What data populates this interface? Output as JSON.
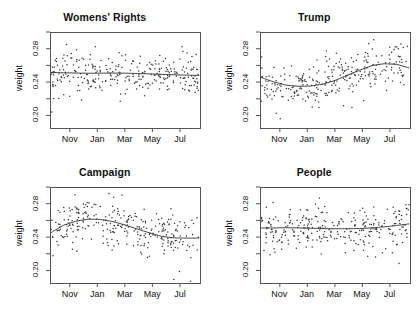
{
  "figure": {
    "background": "#ffffff",
    "point_color": "#333333",
    "line_color": "#444444",
    "axis_color": "#555555",
    "layout": "2x2",
    "panel_order": [
      "womens-rights",
      "trump",
      "campaign",
      "people"
    ]
  },
  "chart_data": [
    {
      "type": "scatter",
      "title": "Womens' Rights",
      "xlabel": "",
      "ylabel": "weight",
      "ylim": [
        0.185,
        0.3
      ],
      "yticks": [
        0.2,
        0.24,
        0.28
      ],
      "ytick_labels": [
        "0.20",
        "0.24",
        "0.28"
      ],
      "ytick_minor": [
        0.22,
        0.26,
        0.3
      ],
      "xticks": [
        "Nov",
        "Jan",
        "Mar",
        "May",
        "Jul"
      ],
      "xlim_months": [
        9.5,
        19.5
      ],
      "grid": false,
      "legend": null,
      "n_points": 290,
      "smoother": "loess",
      "smoother_x": [
        0,
        0.08,
        0.17,
        0.25,
        0.33,
        0.42,
        0.5,
        0.58,
        0.67,
        0.75,
        0.83,
        0.92,
        1.0
      ],
      "smoother_y": [
        0.2515,
        0.2512,
        0.2508,
        0.2506,
        0.2507,
        0.2508,
        0.2507,
        0.2503,
        0.2498,
        0.2492,
        0.2487,
        0.2483,
        0.248
      ],
      "point_spread": 0.019,
      "seed": 11
    },
    {
      "type": "scatter",
      "title": "Trump",
      "xlabel": "",
      "ylabel": "weight",
      "ylim": [
        0.185,
        0.3
      ],
      "yticks": [
        0.2,
        0.24,
        0.28
      ],
      "ytick_labels": [
        "0.20",
        "0.24",
        "0.28"
      ],
      "ytick_minor": [
        0.22,
        0.26,
        0.3
      ],
      "xticks": [
        "Nov",
        "Jan",
        "Mar",
        "May",
        "Jul"
      ],
      "xlim_months": [
        9.5,
        19.5
      ],
      "grid": false,
      "legend": null,
      "n_points": 290,
      "smoother": "loess",
      "smoother_x": [
        0,
        0.08,
        0.17,
        0.25,
        0.33,
        0.42,
        0.5,
        0.58,
        0.67,
        0.75,
        0.83,
        0.92,
        1.0
      ],
      "smoother_y": [
        0.2455,
        0.2405,
        0.2363,
        0.235,
        0.2352,
        0.2375,
        0.242,
        0.248,
        0.2545,
        0.2598,
        0.262,
        0.2612,
        0.257
      ],
      "point_spread": 0.02,
      "seed": 23
    },
    {
      "type": "scatter",
      "title": "Campaign",
      "xlabel": "",
      "ylabel": "weight",
      "ylim": [
        0.185,
        0.3
      ],
      "yticks": [
        0.2,
        0.24,
        0.28
      ],
      "ytick_labels": [
        "0.20",
        "0.24",
        "0.28"
      ],
      "ytick_minor": [
        0.22,
        0.26,
        0.3
      ],
      "xticks": [
        "Nov",
        "Jan",
        "Mar",
        "May",
        "Jul"
      ],
      "xlim_months": [
        9.5,
        19.5
      ],
      "grid": false,
      "legend": null,
      "n_points": 290,
      "smoother": "loess",
      "smoother_x": [
        0,
        0.08,
        0.17,
        0.25,
        0.33,
        0.42,
        0.5,
        0.58,
        0.67,
        0.75,
        0.83,
        0.92,
        1.0
      ],
      "smoother_y": [
        0.2455,
        0.254,
        0.2592,
        0.2615,
        0.2612,
        0.2585,
        0.2545,
        0.2498,
        0.2448,
        0.2408,
        0.239,
        0.2388,
        0.2388
      ],
      "point_spread": 0.021,
      "seed": 37
    },
    {
      "type": "scatter",
      "title": "People",
      "xlabel": "",
      "ylabel": "weight",
      "ylim": [
        0.185,
        0.3
      ],
      "yticks": [
        0.2,
        0.24,
        0.28
      ],
      "ytick_labels": [
        "0.20",
        "0.24",
        "0.28"
      ],
      "ytick_minor": [
        0.22,
        0.26,
        0.3
      ],
      "xticks": [
        "Nov",
        "Jan",
        "Mar",
        "May",
        "Jul"
      ],
      "xlim_months": [
        9.5,
        19.5
      ],
      "grid": false,
      "legend": null,
      "n_points": 290,
      "smoother": "loess",
      "smoother_x": [
        0,
        0.08,
        0.17,
        0.25,
        0.33,
        0.42,
        0.5,
        0.58,
        0.67,
        0.75,
        0.83,
        0.92,
        1.0
      ],
      "smoother_y": [
        0.2508,
        0.251,
        0.2512,
        0.251,
        0.2506,
        0.2502,
        0.25,
        0.25,
        0.2503,
        0.251,
        0.2522,
        0.254,
        0.2558
      ],
      "point_spread": 0.02,
      "seed": 53
    }
  ]
}
